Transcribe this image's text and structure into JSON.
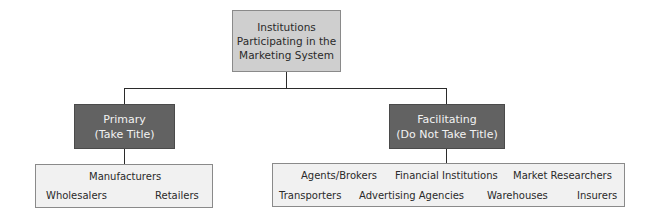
{
  "diagram": {
    "root": {
      "lines": [
        "Institutions",
        "Participating in the",
        "Marketing System"
      ]
    },
    "primary": {
      "title": "Primary",
      "subtitle": "(Take Title)",
      "items": [
        "Manufacturers",
        "Wholesalers",
        "Retailers"
      ]
    },
    "facilitating": {
      "title": "Facilitating",
      "subtitle": "(Do Not Take Title)",
      "items": [
        "Agents/Brokers",
        "Financial Institutions",
        "Market Researchers",
        "Transporters",
        "Advertising Agencies",
        "Warehouses",
        "Insurers"
      ]
    },
    "colors": {
      "root_fill": "#cfcfcf",
      "category_fill": "#626262",
      "leaf_fill": "#f1f1f1",
      "line": "#2b2b2b"
    }
  }
}
